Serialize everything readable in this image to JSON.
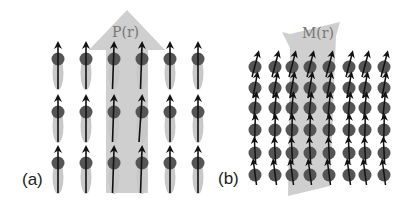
{
  "figure": {
    "panels": [
      {
        "id": "a",
        "label": "(a)",
        "field_label": "P(r)",
        "description": "Polarization field: 6x3 grid of dipoles with light elongated shadows, large vertical arrow",
        "columns_x": [
          58,
          86,
          114,
          142,
          170,
          198
        ],
        "rows_y": [
          59,
          112,
          163
        ],
        "colors": {
          "field_arrow": "#cfcfcf",
          "dot": "#555555",
          "shadow": "#c8c8c8",
          "arrow": "#111111"
        }
      },
      {
        "id": "b",
        "label": "(b)",
        "field_label": "M(r)",
        "description": "Magnetization field: 8x6 grid of tilted spins, large tilted arrow",
        "columns_x": [
          255,
          275,
          292,
          310,
          329,
          349,
          365,
          384
        ],
        "rows_y": [
          67,
          88,
          108,
          130,
          153,
          175
        ],
        "colors": {
          "field_arrow": "#cfcfcf",
          "dot": "#555555",
          "arrow": "#111111"
        }
      }
    ]
  }
}
